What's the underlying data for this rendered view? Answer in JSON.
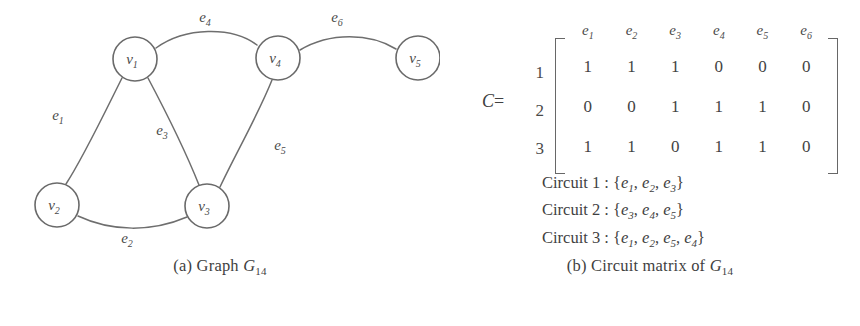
{
  "figure": {
    "panels": [
      {
        "id": "a",
        "caption_prefix": "(a)",
        "caption_text": "Graph",
        "caption_symbol": "G",
        "caption_symbol_sub": "14"
      },
      {
        "id": "b",
        "caption_prefix": "(b)",
        "caption_text": "Circuit matrix of",
        "caption_symbol": "G",
        "caption_symbol_sub": "14"
      }
    ]
  },
  "graph": {
    "vertices": [
      {
        "name": "v1",
        "label": "v",
        "sub": "1",
        "cx": 135,
        "cy": 59,
        "r": 22
      },
      {
        "name": "v2",
        "label": "v",
        "sub": "2",
        "cx": 57,
        "cy": 205,
        "r": 22
      },
      {
        "name": "v3",
        "label": "v",
        "sub": "3",
        "cx": 207,
        "cy": 206,
        "r": 22
      },
      {
        "name": "v4",
        "label": "v",
        "sub": "4",
        "cx": 278,
        "cy": 58,
        "r": 22
      },
      {
        "name": "v5",
        "label": "v",
        "sub": "5",
        "cx": 418,
        "cy": 58,
        "r": 22
      }
    ],
    "edges": [
      {
        "name": "e1",
        "label": "e",
        "sub": "1",
        "from": "v1",
        "to": "v2",
        "lx": 58,
        "ly": 120
      },
      {
        "name": "e2",
        "label": "e",
        "sub": "2",
        "from": "v2",
        "to": "v3",
        "lx": 127,
        "ly": 243
      },
      {
        "name": "e3",
        "label": "e",
        "sub": "3",
        "from": "v1",
        "to": "v3",
        "lx": 162,
        "ly": 135
      },
      {
        "name": "e4",
        "label": "e",
        "sub": "4",
        "from": "v1",
        "to": "v4",
        "lx": 205,
        "ly": 22
      },
      {
        "name": "e5",
        "label": "e",
        "sub": "5",
        "from": "v4",
        "to": "v3",
        "lx": 280,
        "ly": 150
      },
      {
        "name": "e6",
        "label": "e",
        "sub": "6",
        "from": "v4",
        "to": "v5",
        "lx": 337,
        "ly": 22
      }
    ],
    "paths": {
      "e1": "M 122,78 C 105,112 83,158 66,184",
      "e2": "M 78,216 C 112,232 152,232 187,217",
      "e3": "M 148,78 C 166,112 185,150 199,185",
      "e4": "M 156,48 C 185,27 232,26 257,45",
      "e5": "M 272,80 C 258,115 235,155 220,187",
      "e6": "M 300,50 C 330,32 370,33 396,49"
    }
  },
  "matrix": {
    "name_label": "C",
    "equals": "=",
    "column_headers": [
      {
        "label": "e",
        "sub": "1"
      },
      {
        "label": "e",
        "sub": "2"
      },
      {
        "label": "e",
        "sub": "3"
      },
      {
        "label": "e",
        "sub": "4"
      },
      {
        "label": "e",
        "sub": "5"
      },
      {
        "label": "e",
        "sub": "6"
      }
    ],
    "row_labels": [
      "1",
      "2",
      "3"
    ],
    "rows": [
      [
        "1",
        "1",
        "1",
        "0",
        "0",
        "0"
      ],
      [
        "0",
        "0",
        "1",
        "1",
        "1",
        "0"
      ],
      [
        "1",
        "1",
        "0",
        "1",
        "1",
        "0"
      ]
    ]
  },
  "circuits": [
    {
      "name": "Circuit 1",
      "separator": ":",
      "open": "{",
      "close": "}",
      "members": [
        {
          "label": "e",
          "sub": "1"
        },
        {
          "label": "e",
          "sub": "2"
        },
        {
          "label": "e",
          "sub": "3"
        }
      ]
    },
    {
      "name": "Circuit 2",
      "separator": ":",
      "open": "{",
      "close": "}",
      "members": [
        {
          "label": "e",
          "sub": "3"
        },
        {
          "label": "e",
          "sub": "4"
        },
        {
          "label": "e",
          "sub": "5"
        }
      ]
    },
    {
      "name": "Circuit 3",
      "separator": ":",
      "open": "{",
      "close": "}",
      "members": [
        {
          "label": "e",
          "sub": "1"
        },
        {
          "label": "e",
          "sub": "2"
        },
        {
          "label": "e",
          "sub": "5"
        },
        {
          "label": "e",
          "sub": "4"
        }
      ]
    }
  ],
  "colors": {
    "background": "#ffffff",
    "ink": "#4a4a4a",
    "stroke": "#6e6e6e"
  }
}
